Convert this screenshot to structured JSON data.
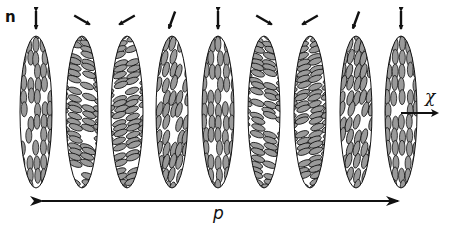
{
  "diagram": {
    "type": "cholesteric-helix-schematic",
    "labels": {
      "director": "n",
      "helix_axis": "χ",
      "pitch": "p"
    },
    "colors": {
      "stroke": "#111111",
      "molecule_fill": "#9a9a9a",
      "background": "#ffffff"
    },
    "layers": [
      {
        "cx": 36,
        "director_angle_deg": 0
      },
      {
        "cx": 82,
        "director_angle_deg": -60
      },
      {
        "cx": 127,
        "director_angle_deg": 60
      },
      {
        "cx": 172,
        "director_angle_deg": 20
      },
      {
        "cx": 218,
        "director_angle_deg": 0
      },
      {
        "cx": 264,
        "director_angle_deg": -60
      },
      {
        "cx": 310,
        "director_angle_deg": 60
      },
      {
        "cx": 356,
        "director_angle_deg": 20
      },
      {
        "cx": 401,
        "director_angle_deg": 0
      }
    ]
  }
}
